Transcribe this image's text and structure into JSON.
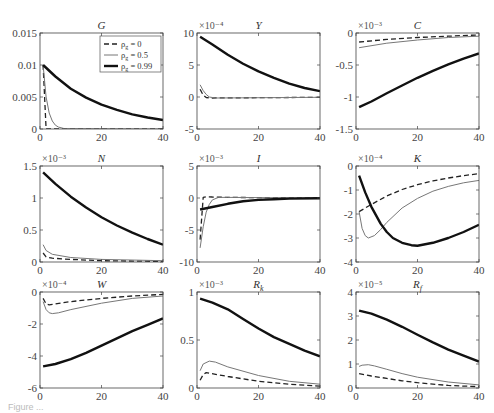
{
  "figure": {
    "caption_fragment": "Figure ..."
  },
  "legend": {
    "entries": [
      {
        "label": "ρ_g = 0",
        "style": "dashed"
      },
      {
        "label": "ρ_g = 0.5",
        "style": "thin"
      },
      {
        "label": "ρ_g = 0.99",
        "style": "thick"
      }
    ]
  },
  "chart_data": [
    {
      "type": "line",
      "title": "G",
      "scale_label": "",
      "xlim": [
        0,
        40
      ],
      "xticks": [
        0,
        20,
        40
      ],
      "ylim": [
        0,
        0.015
      ],
      "yticks": [
        0,
        0.005,
        0.01,
        0.015
      ],
      "ytick_labels": [
        "0",
        "0.005",
        "0.01",
        "0.015"
      ],
      "legend": true,
      "series": [
        {
          "name": "ρ_g = 0",
          "style": "dashed",
          "x": [
            1,
            1.5,
            2,
            3,
            40
          ],
          "y": [
            0.01,
            0.005,
            0,
            0,
            0
          ]
        },
        {
          "name": "ρ_g = 0.5",
          "style": "thin",
          "x": [
            1,
            2,
            3,
            4,
            5,
            6,
            8,
            40
          ],
          "y": [
            0.01,
            0.005,
            0.0025,
            0.00125,
            0.0006,
            0.0003,
            5e-05,
            0
          ]
        },
        {
          "name": "ρ_g = 0.99",
          "style": "thick",
          "x": [
            1,
            5,
            10,
            15,
            20,
            25,
            30,
            35,
            40
          ],
          "y": [
            0.01,
            0.0082,
            0.0063,
            0.0049,
            0.0038,
            0.003,
            0.0023,
            0.0018,
            0.0014
          ]
        }
      ]
    },
    {
      "type": "line",
      "title": "Y",
      "scale_label": "×10⁻⁴",
      "xlim": [
        0,
        40
      ],
      "xticks": [
        0,
        20,
        40
      ],
      "ylim": [
        -5,
        10
      ],
      "yticks": [
        -5,
        0,
        5,
        10
      ],
      "ytick_labels": [
        "-5",
        "0",
        "5",
        "10"
      ],
      "series": [
        {
          "name": "ρ_g = 0",
          "style": "dashed",
          "x": [
            1,
            2,
            3,
            5,
            40
          ],
          "y": [
            1.2,
            0.3,
            -0.1,
            -0.15,
            -0.05
          ]
        },
        {
          "name": "ρ_g = 0.5",
          "style": "thin",
          "x": [
            1,
            2,
            3,
            4,
            6,
            40
          ],
          "y": [
            1.9,
            1.0,
            0.4,
            0.0,
            -0.15,
            -0.05
          ]
        },
        {
          "name": "ρ_g = 0.99",
          "style": "thick",
          "x": [
            1,
            5,
            10,
            15,
            20,
            25,
            30,
            35,
            40
          ],
          "y": [
            9.4,
            8.2,
            6.6,
            5.2,
            4.0,
            3.0,
            2.1,
            1.4,
            0.9
          ]
        }
      ]
    },
    {
      "type": "line",
      "title": "C",
      "scale_label": "×10⁻³",
      "xlim": [
        0,
        40
      ],
      "xticks": [
        0,
        20,
        40
      ],
      "ylim": [
        -1.5,
        0
      ],
      "yticks": [
        -1.5,
        -1,
        -0.5,
        0
      ],
      "ytick_labels": [
        "-1.5",
        "-1",
        "-0.5",
        "0"
      ],
      "series": [
        {
          "name": "ρ_g = 0",
          "style": "dashed",
          "x": [
            1,
            10,
            20,
            30,
            40
          ],
          "y": [
            -0.14,
            -0.1,
            -0.07,
            -0.05,
            -0.03
          ]
        },
        {
          "name": "ρ_g = 0.5",
          "style": "thin",
          "x": [
            1,
            10,
            20,
            30,
            40
          ],
          "y": [
            -0.23,
            -0.16,
            -0.11,
            -0.07,
            -0.05
          ]
        },
        {
          "name": "ρ_g = 0.99",
          "style": "thick",
          "x": [
            1,
            5,
            10,
            15,
            20,
            25,
            30,
            35,
            40
          ],
          "y": [
            -1.16,
            -1.07,
            -0.94,
            -0.82,
            -0.7,
            -0.59,
            -0.49,
            -0.4,
            -0.32
          ]
        }
      ]
    },
    {
      "type": "line",
      "title": "N",
      "scale_label": "×10⁻³",
      "xlim": [
        0,
        40
      ],
      "xticks": [
        0,
        20,
        40
      ],
      "ylim": [
        0,
        1.5
      ],
      "yticks": [
        0,
        0.5,
        1,
        1.5
      ],
      "ytick_labels": [
        "0",
        "0.5",
        "1",
        "1.5"
      ],
      "series": [
        {
          "name": "ρ_g = 0",
          "style": "dashed",
          "x": [
            1,
            2,
            4,
            10,
            20,
            40
          ],
          "y": [
            0.14,
            0.08,
            0.06,
            0.04,
            0.02,
            0.01
          ]
        },
        {
          "name": "ρ_g = 0.5",
          "style": "thin",
          "x": [
            1,
            2,
            4,
            10,
            20,
            40
          ],
          "y": [
            0.27,
            0.18,
            0.12,
            0.07,
            0.04,
            0.02
          ]
        },
        {
          "name": "ρ_g = 0.99",
          "style": "thick",
          "x": [
            1,
            5,
            10,
            15,
            20,
            25,
            30,
            35,
            40
          ],
          "y": [
            1.4,
            1.22,
            1.02,
            0.85,
            0.7,
            0.57,
            0.46,
            0.36,
            0.27
          ]
        }
      ]
    },
    {
      "type": "line",
      "title": "I",
      "scale_label": "×10⁻³",
      "xlim": [
        0,
        40
      ],
      "xticks": [
        0,
        20,
        40
      ],
      "ylim": [
        -10,
        5
      ],
      "yticks": [
        -10,
        -5,
        0,
        5
      ],
      "ytick_labels": [
        "-10",
        "-5",
        "0",
        "5"
      ],
      "series": [
        {
          "name": "ρ_g = 0",
          "style": "dashed",
          "x": [
            1,
            2,
            3,
            5,
            10,
            40
          ],
          "y": [
            -6.5,
            0.1,
            0.2,
            0.15,
            0.1,
            0.0
          ]
        },
        {
          "name": "ρ_g = 0.5",
          "style": "thin",
          "x": [
            1,
            2,
            3,
            4,
            5,
            7,
            10,
            40
          ],
          "y": [
            -7.8,
            -4.5,
            -2.2,
            -1.0,
            -0.3,
            0.1,
            0.1,
            0.0
          ]
        },
        {
          "name": "ρ_g = 0.99",
          "style": "thick",
          "x": [
            1,
            5,
            10,
            15,
            20,
            25,
            30,
            40
          ],
          "y": [
            -1.8,
            -1.4,
            -0.9,
            -0.5,
            -0.3,
            -0.2,
            -0.1,
            -0.05
          ]
        }
      ]
    },
    {
      "type": "line",
      "title": "K",
      "scale_label": "×10⁻⁴",
      "xlim": [
        0,
        40
      ],
      "xticks": [
        0,
        20,
        40
      ],
      "ylim": [
        -4,
        0
      ],
      "yticks": [
        -4,
        -3,
        -2,
        -1,
        0
      ],
      "ytick_labels": [
        "-4",
        "-3",
        "-2",
        "-1",
        "0"
      ],
      "series": [
        {
          "name": "ρ_g = 0",
          "style": "dashed",
          "x": [
            1,
            5,
            10,
            15,
            20,
            25,
            30,
            35,
            40
          ],
          "y": [
            -1.9,
            -1.6,
            -1.25,
            -0.98,
            -0.78,
            -0.62,
            -0.5,
            -0.4,
            -0.32
          ]
        },
        {
          "name": "ρ_g = 0.5",
          "style": "thin",
          "x": [
            1,
            2,
            3,
            4,
            6,
            8,
            10,
            15,
            20,
            25,
            30,
            35,
            40
          ],
          "y": [
            -1.9,
            -2.6,
            -2.9,
            -3.0,
            -2.9,
            -2.65,
            -2.35,
            -1.75,
            -1.35,
            -1.05,
            -0.85,
            -0.7,
            -0.6
          ]
        },
        {
          "name": "ρ_g = 0.99",
          "style": "thick",
          "x": [
            1,
            3,
            5,
            8,
            10,
            12,
            15,
            18,
            20,
            25,
            30,
            35,
            40
          ],
          "y": [
            -0.4,
            -1.1,
            -1.7,
            -2.4,
            -2.75,
            -3.0,
            -3.2,
            -3.3,
            -3.32,
            -3.2,
            -3.0,
            -2.75,
            -2.45
          ]
        }
      ]
    },
    {
      "type": "line",
      "title": "W",
      "scale_label": "×10⁻⁴",
      "xlim": [
        0,
        40
      ],
      "xticks": [
        0,
        20,
        40
      ],
      "ylim": [
        -6,
        0
      ],
      "yticks": [
        -6,
        -4,
        -2,
        0
      ],
      "ytick_labels": [
        "-6",
        "-4",
        "-2",
        "0"
      ],
      "series": [
        {
          "name": "ρ_g = 0",
          "style": "dashed",
          "x": [
            1,
            2,
            3,
            10,
            20,
            30,
            40
          ],
          "y": [
            -0.4,
            -0.75,
            -0.8,
            -0.6,
            -0.4,
            -0.25,
            -0.15
          ]
        },
        {
          "name": "ρ_g = 0.5",
          "style": "thin",
          "x": [
            1,
            2,
            3,
            4,
            6,
            10,
            20,
            30,
            40
          ],
          "y": [
            -0.6,
            -1.1,
            -1.3,
            -1.35,
            -1.3,
            -1.1,
            -0.7,
            -0.4,
            -0.25
          ]
        },
        {
          "name": "ρ_g = 0.99",
          "style": "thick",
          "x": [
            1,
            5,
            10,
            15,
            20,
            25,
            30,
            35,
            40
          ],
          "y": [
            -4.65,
            -4.5,
            -4.2,
            -3.8,
            -3.35,
            -2.9,
            -2.45,
            -2.05,
            -1.65
          ]
        }
      ]
    },
    {
      "type": "line",
      "title": "R_k",
      "scale_label": "×10⁻³",
      "xlim": [
        0,
        40
      ],
      "xticks": [
        0,
        20,
        40
      ],
      "ylim": [
        0,
        1
      ],
      "yticks": [
        0,
        0.5,
        1
      ],
      "ytick_labels": [
        "0",
        "0.5",
        "1"
      ],
      "series": [
        {
          "name": "ρ_g = 0",
          "style": "dashed",
          "x": [
            1,
            2,
            3,
            10,
            20,
            30,
            40
          ],
          "y": [
            0.08,
            0.14,
            0.16,
            0.12,
            0.07,
            0.04,
            0.02
          ]
        },
        {
          "name": "ρ_g = 0.5",
          "style": "thin",
          "x": [
            1,
            2,
            4,
            6,
            10,
            20,
            30,
            40
          ],
          "y": [
            0.18,
            0.25,
            0.28,
            0.27,
            0.22,
            0.13,
            0.07,
            0.04
          ]
        },
        {
          "name": "ρ_g = 0.99",
          "style": "thick",
          "x": [
            1,
            5,
            10,
            15,
            20,
            25,
            30,
            35,
            40
          ],
          "y": [
            0.93,
            0.89,
            0.82,
            0.72,
            0.62,
            0.53,
            0.46,
            0.39,
            0.33
          ]
        }
      ]
    },
    {
      "type": "line",
      "title": "R_f",
      "scale_label": "×10⁻⁵",
      "xlim": [
        0,
        40
      ],
      "xticks": [
        0,
        20,
        40
      ],
      "ylim": [
        0,
        4
      ],
      "yticks": [
        0,
        1,
        2,
        3,
        4
      ],
      "ytick_labels": [
        "0",
        "1",
        "2",
        "3",
        "4"
      ],
      "series": [
        {
          "name": "ρ_g = 0",
          "style": "dashed",
          "x": [
            1,
            5,
            10,
            15,
            20,
            25,
            30,
            35,
            40
          ],
          "y": [
            0.6,
            0.5,
            0.4,
            0.3,
            0.22,
            0.16,
            0.11,
            0.08,
            0.06
          ]
        },
        {
          "name": "ρ_g = 0.5",
          "style": "thin",
          "x": [
            1,
            2,
            4,
            6,
            10,
            15,
            20,
            30,
            40
          ],
          "y": [
            0.9,
            0.95,
            0.97,
            0.92,
            0.78,
            0.6,
            0.45,
            0.25,
            0.13
          ]
        },
        {
          "name": "ρ_g = 0.99",
          "style": "thick",
          "x": [
            1,
            5,
            10,
            15,
            20,
            25,
            30,
            35,
            40
          ],
          "y": [
            3.22,
            3.1,
            2.85,
            2.55,
            2.22,
            1.9,
            1.6,
            1.35,
            1.1
          ]
        }
      ]
    }
  ]
}
